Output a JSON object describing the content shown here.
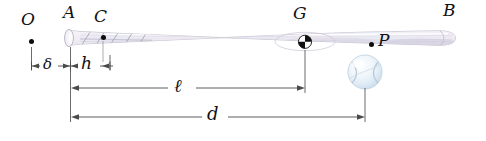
{
  "figure": {
    "background_color": "#ffffff",
    "line_color": "#4a4a4a",
    "point_color": "#0d0d0d"
  },
  "points": [
    {
      "id": "O",
      "label": "O",
      "kind": "pivot-point",
      "x": 31,
      "y": 41,
      "label_x": 21,
      "label_y": 11,
      "has_dot": true
    },
    {
      "id": "A",
      "label": "A",
      "kind": "knob-point",
      "x": 68,
      "y": 39,
      "label_x": 63,
      "label_y": 4,
      "has_dot": false
    },
    {
      "id": "C",
      "label": "C",
      "kind": "grip-point",
      "x": 103,
      "y": 38,
      "label_x": 94,
      "label_y": 8,
      "has_dot": true
    },
    {
      "id": "G",
      "label": "G",
      "kind": "center-of-mass-point",
      "x": 305,
      "y": 43,
      "label_x": 293,
      "label_y": 5,
      "has_dot": false
    },
    {
      "id": "P",
      "label": "P",
      "kind": "center-of-percussion-point",
      "x": 371,
      "y": 45,
      "label_x": 378,
      "label_y": 32,
      "has_dot": true
    },
    {
      "id": "B",
      "label": "B",
      "kind": "barrel-end-point",
      "x": 455,
      "y": 30,
      "label_x": 443,
      "label_y": 2,
      "has_dot": false
    }
  ],
  "dimensions": [
    {
      "id": "delta",
      "label": "δ",
      "from": "O",
      "to": "A",
      "x1": 31,
      "x2": 68,
      "y": 66,
      "label_x": 43,
      "label_y": 58,
      "style": "outward-arrows"
    },
    {
      "id": "h",
      "label": "h",
      "kind": "knob-to-grip",
      "from": "A",
      "to": "C",
      "x1": 68,
      "x2": 110,
      "y": 66,
      "label_x": 81,
      "label_y": 57,
      "style": "outward-arrows"
    },
    {
      "id": "ell",
      "label": "ℓ",
      "kind": "knob-to-center-of-mass",
      "from": "A",
      "to": "G",
      "x1": 71,
      "x2": 305,
      "y": 88,
      "label_x": 181,
      "label_y": 76,
      "style": "double-arrow"
    },
    {
      "id": "d",
      "label": "d",
      "kind": "knob-to-impact-point",
      "from": "A",
      "to": "ball",
      "x1": 71,
      "x2": 365,
      "y": 117,
      "label_x": 214,
      "label_y": 104,
      "style": "double-arrow"
    }
  ],
  "bat": {
    "name": "baseball-bat",
    "knob_x": 68,
    "tip_x": 455,
    "fill_light": "#fdfdfe",
    "fill_mid": "#eceaf2",
    "fill_shadow": "#d8d5e2",
    "tint_pink": "#f0e2ea",
    "tint_blue": "#e2e8f2",
    "outline": "#b9b6c4",
    "grip_tape_color": "#9c99a8"
  },
  "ball": {
    "name": "baseball",
    "cx": 365,
    "cy": 72,
    "r": 17,
    "fill": "#e8f1f8",
    "highlight": "#ffffff",
    "seam_color": "#b9c9d8",
    "outline": "#c3d2de"
  }
}
